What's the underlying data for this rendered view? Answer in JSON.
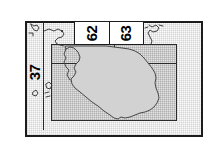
{
  "figure": {
    "kind": "index-map"
  },
  "colors": {
    "frame_stroke": "#1c1c1c",
    "inner_rect_stroke": "#2a2a2a",
    "inner_rect_fill": "#e3e3e3",
    "land_fill": "#d2d2d2",
    "land_stroke": "#3a3a3a",
    "panel_background": "#fcfcfc",
    "callout_background": "#ffffff",
    "label_text": "#000000"
  },
  "zone_labels": {
    "top": [
      {
        "id": "zone-62",
        "text": "62",
        "rotation": -90
      },
      {
        "id": "zone-63",
        "text": "63",
        "rotation": -90
      }
    ],
    "left": [
      {
        "id": "zone-37",
        "text": "37",
        "rotation": -90
      }
    ]
  },
  "frames": {
    "outer": {
      "name": "outer-map-frame",
      "x": 25,
      "y": 21,
      "width": 178,
      "height": 116
    },
    "inner": {
      "name": "detail-extent-rectangle",
      "x": 51,
      "y": 44,
      "width": 126,
      "height": 77
    }
  }
}
